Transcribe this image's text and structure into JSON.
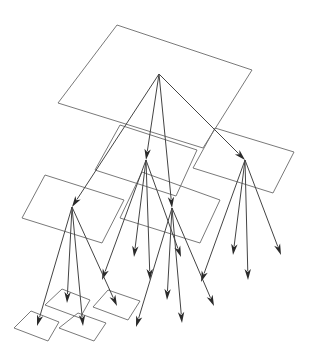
{
  "diagram": {
    "title": "",
    "colors": {
      "background": "#ffffff",
      "plane_stroke": "#6a6a6a",
      "edge_stroke": "#444444",
      "arrowhead": "#2a2a2a"
    },
    "levels": [
      {
        "level": 0,
        "name": "root",
        "plane_count": 1
      },
      {
        "level": 1,
        "name": "children",
        "plane_count": 3
      },
      {
        "level": 2,
        "name": "grandchildren",
        "plane_count": 1
      },
      {
        "level": 3,
        "name": "leaves",
        "plane_count": 4
      }
    ],
    "nodes": [
      {
        "id": "root",
        "plane": "P0"
      },
      {
        "id": "n_mid_back",
        "plane": "P1"
      },
      {
        "id": "n_right",
        "plane": "P2"
      },
      {
        "id": "n_left",
        "plane": "P3"
      },
      {
        "id": "n_mid_front",
        "plane": "P4"
      },
      {
        "id": "leaf_a",
        "plane": "L1"
      },
      {
        "id": "leaf_b",
        "plane": "L2"
      },
      {
        "id": "leaf_c",
        "plane": "L3"
      },
      {
        "id": "leaf_d",
        "plane": "L4"
      }
    ],
    "edges": [
      {
        "from": "root",
        "to": "n_mid_back"
      },
      {
        "from": "root",
        "to": "n_right"
      },
      {
        "from": "root",
        "to": "n_left"
      },
      {
        "from": "root",
        "to": "n_mid_front"
      },
      {
        "from": "n_mid_back",
        "to": "free_1"
      },
      {
        "from": "n_mid_back",
        "to": "free_2"
      },
      {
        "from": "n_mid_back",
        "to": "free_3"
      },
      {
        "from": "n_mid_back",
        "to": "free_4"
      },
      {
        "from": "n_mid_front",
        "to": "free_5"
      },
      {
        "from": "n_mid_front",
        "to": "free_6"
      },
      {
        "from": "n_mid_front",
        "to": "free_7"
      },
      {
        "from": "n_mid_front",
        "to": "free_8"
      },
      {
        "from": "n_right",
        "to": "free_9"
      },
      {
        "from": "n_right",
        "to": "free_10"
      },
      {
        "from": "n_right",
        "to": "free_11"
      },
      {
        "from": "n_right",
        "to": "free_12"
      },
      {
        "from": "n_left",
        "to": "leaf_a"
      },
      {
        "from": "n_left",
        "to": "leaf_b"
      },
      {
        "from": "n_left",
        "to": "leaf_c"
      },
      {
        "from": "n_left",
        "to": "leaf_d"
      }
    ]
  }
}
